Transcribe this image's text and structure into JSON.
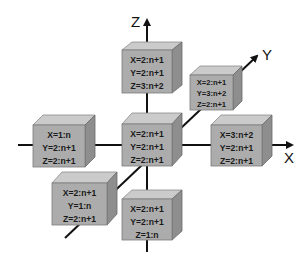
{
  "diagram": {
    "axes": {
      "x": {
        "label": "X"
      },
      "y": {
        "label": "Y"
      },
      "z": {
        "label": "Z"
      }
    },
    "colors": {
      "front": "#acacac",
      "top": "#cbcbcb",
      "side": "#8e8e8e",
      "axis": "#111111"
    },
    "cubes": [
      {
        "id": "top",
        "lines": [
          "X=2:n+1",
          "Y=2:n+1",
          "Z=3:n+2"
        ]
      },
      {
        "id": "y-pos",
        "lines": [
          "X=2:n+1",
          "Y=3:n+2",
          "Z=2:n+1"
        ]
      },
      {
        "id": "x-neg",
        "lines": [
          "X=1:n",
          "Y=2:n+1",
          "Z=2:n+1"
        ]
      },
      {
        "id": "center",
        "lines": [
          "X=2:n+1",
          "Y=2:n+1",
          "Z=2:n+1"
        ]
      },
      {
        "id": "x-pos",
        "lines": [
          "X=3:n+2",
          "Y=2:n+1",
          "Z=2:n+1"
        ]
      },
      {
        "id": "y-neg",
        "lines": [
          "X=2:n+1",
          "Y=1:n",
          "Z=2:n+1"
        ]
      },
      {
        "id": "bottom",
        "lines": [
          "X=2:n+1",
          "Y=2:n+1",
          "Z=1:n"
        ]
      }
    ]
  }
}
